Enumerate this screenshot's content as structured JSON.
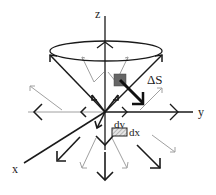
{
  "diagram": {
    "type": "3d-vector-field-cone",
    "axes": {
      "x": "x",
      "y": "y",
      "z": "z"
    },
    "labels": {
      "surface_element": "ΔS",
      "dy": "dy",
      "dx": "dx"
    },
    "colors": {
      "dark_arrow": "#1a1a1a",
      "light_arrow": "#9a9a9a",
      "surface_patch": "#666666",
      "hatched_patch": "#bbbbbb"
    }
  }
}
